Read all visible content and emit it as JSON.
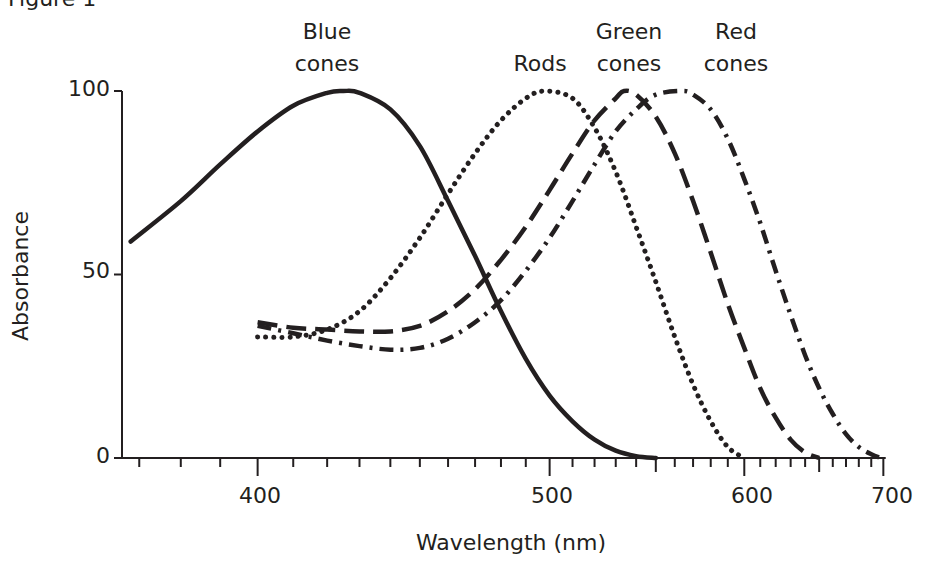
{
  "figure": {
    "title": "Figure 1"
  },
  "chart_data": {
    "type": "line",
    "title": "Figure 1",
    "xlabel": "Wavelength (nm)",
    "ylabel": "Absorbance",
    "xscale": "reciprocal (1/wavelength)",
    "xlim": [
      366,
      702
    ],
    "ylim": [
      0,
      100
    ],
    "x_ticks_major": [
      400,
      500,
      600,
      700
    ],
    "x_ticks_minor": [
      370,
      380,
      390,
      410,
      420,
      430,
      440,
      450,
      460,
      470,
      480,
      490,
      510,
      520,
      530,
      540,
      550,
      560,
      570,
      580,
      590,
      610,
      620,
      630,
      640,
      650,
      660,
      670,
      680,
      690
    ],
    "x_ticks_medium": [
      550,
      650
    ],
    "y_ticks": [
      0,
      50,
      100
    ],
    "grid": false,
    "legend": "inline labels above peaks",
    "series": [
      {
        "name": "Blue cones",
        "label_lines": [
          "Blue",
          "cones"
        ],
        "style": "solid",
        "points": [
          [
            368,
            59
          ],
          [
            380,
            70
          ],
          [
            390,
            80
          ],
          [
            400,
            89
          ],
          [
            410,
            96
          ],
          [
            420,
            99.5
          ],
          [
            425,
            100
          ],
          [
            430,
            99.5
          ],
          [
            440,
            95
          ],
          [
            450,
            85
          ],
          [
            460,
            70
          ],
          [
            470,
            55
          ],
          [
            480,
            40
          ],
          [
            490,
            27
          ],
          [
            500,
            17
          ],
          [
            510,
            10
          ],
          [
            520,
            5
          ],
          [
            530,
            2
          ],
          [
            540,
            0.5
          ],
          [
            550,
            0
          ]
        ]
      },
      {
        "name": "Rods",
        "label_lines": [
          "Rods"
        ],
        "style": "dotted",
        "points": [
          [
            400,
            33
          ],
          [
            410,
            33
          ],
          [
            420,
            35
          ],
          [
            430,
            40
          ],
          [
            440,
            49
          ],
          [
            450,
            60
          ],
          [
            460,
            72
          ],
          [
            470,
            83
          ],
          [
            480,
            92
          ],
          [
            490,
            98
          ],
          [
            498,
            100
          ],
          [
            510,
            98
          ],
          [
            520,
            90
          ],
          [
            530,
            78
          ],
          [
            540,
            63
          ],
          [
            550,
            48
          ],
          [
            560,
            33
          ],
          [
            570,
            20
          ],
          [
            580,
            10
          ],
          [
            590,
            3
          ],
          [
            600,
            0
          ]
        ]
      },
      {
        "name": "Green cones",
        "label_lines": [
          "Green",
          "cones"
        ],
        "style": "dashed",
        "points": [
          [
            400,
            37
          ],
          [
            410,
            35.5
          ],
          [
            420,
            35
          ],
          [
            430,
            34.5
          ],
          [
            440,
            34.5
          ],
          [
            450,
            36
          ],
          [
            460,
            40
          ],
          [
            470,
            46
          ],
          [
            480,
            54
          ],
          [
            490,
            63
          ],
          [
            500,
            73
          ],
          [
            510,
            83
          ],
          [
            520,
            92
          ],
          [
            530,
            98
          ],
          [
            534,
            100
          ],
          [
            540,
            99
          ],
          [
            550,
            93
          ],
          [
            560,
            83
          ],
          [
            570,
            70
          ],
          [
            580,
            56
          ],
          [
            590,
            42
          ],
          [
            600,
            30
          ],
          [
            610,
            19
          ],
          [
            620,
            11
          ],
          [
            630,
            5
          ],
          [
            640,
            1.5
          ],
          [
            650,
            0
          ]
        ]
      },
      {
        "name": "Red cones",
        "label_lines": [
          "Red",
          "cones"
        ],
        "style": "dash-dot",
        "points": [
          [
            400,
            36
          ],
          [
            410,
            34
          ],
          [
            420,
            32
          ],
          [
            430,
            30.5
          ],
          [
            440,
            29.5
          ],
          [
            450,
            30
          ],
          [
            460,
            32.5
          ],
          [
            470,
            37
          ],
          [
            480,
            43
          ],
          [
            490,
            51
          ],
          [
            500,
            60
          ],
          [
            510,
            70
          ],
          [
            520,
            80
          ],
          [
            530,
            89
          ],
          [
            540,
            95
          ],
          [
            550,
            99
          ],
          [
            564,
            100
          ],
          [
            570,
            99
          ],
          [
            580,
            95
          ],
          [
            590,
            87
          ],
          [
            600,
            76
          ],
          [
            610,
            64
          ],
          [
            620,
            51
          ],
          [
            630,
            39
          ],
          [
            640,
            28
          ],
          [
            650,
            19
          ],
          [
            660,
            12
          ],
          [
            670,
            6.5
          ],
          [
            680,
            3
          ],
          [
            690,
            1
          ],
          [
            698,
            0
          ]
        ]
      }
    ]
  },
  "axes": {
    "y_tick_labels": [
      "100",
      "50",
      "0"
    ],
    "x_tick_labels": [
      "400",
      "500",
      "600",
      "700"
    ],
    "xlabel": "Wavelength (nm)",
    "ylabel": "Absorbance"
  },
  "labels": {
    "blue": [
      "Blue",
      "cones"
    ],
    "rods": [
      "Rods"
    ],
    "green": [
      "Green",
      "cones"
    ],
    "red": [
      "Red",
      "cones"
    ]
  }
}
